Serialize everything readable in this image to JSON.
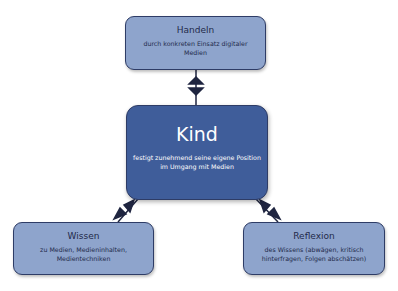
{
  "diagram": {
    "top": {
      "title": "Handeln",
      "subtitle": "durch konkreten Einsatz digitaler Medien"
    },
    "center": {
      "title": "Kind",
      "subtitle": "festigt zunehmend seine eigene Position im Umgang mit Medien"
    },
    "left": {
      "title": "Wissen",
      "subtitle": "zu Medien, Medieninhalten, Medientechniken"
    },
    "right": {
      "title": "Reflexion",
      "subtitle": "des Wissens (abwägen, kritisch hinterfragen, Folgen abschätzen)"
    },
    "connectors": [
      {
        "from": "top",
        "to": "center",
        "type": "double-arrow"
      },
      {
        "from": "center",
        "to": "left",
        "type": "double-arrow"
      },
      {
        "from": "center",
        "to": "right",
        "type": "double-arrow"
      }
    ],
    "colors": {
      "light_box": "#8ea4cc",
      "dark_box": "#3f5d9a",
      "border": "#2e3c66",
      "arrow": "#1f2540"
    }
  }
}
